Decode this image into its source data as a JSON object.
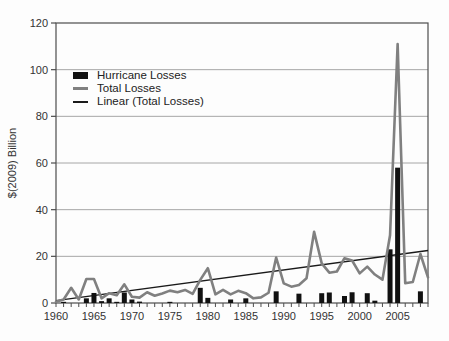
{
  "chart_data": {
    "type": "combo-bar-line",
    "title": "",
    "xlabel": "",
    "ylabel": "$(2009) Billion",
    "ylim": [
      0,
      120
    ],
    "xlim": [
      1960,
      2009
    ],
    "y_ticks": [
      0,
      20,
      40,
      60,
      80,
      100,
      120
    ],
    "x_tick_labels": [
      1960,
      1965,
      1970,
      1975,
      1980,
      1985,
      1990,
      1995,
      2000,
      2005
    ],
    "grid": "horizontal-only",
    "legend_position": "upper-left-inside",
    "years": [
      1960,
      1961,
      1962,
      1963,
      1964,
      1965,
      1966,
      1967,
      1968,
      1969,
      1970,
      1971,
      1972,
      1973,
      1974,
      1975,
      1976,
      1977,
      1978,
      1979,
      1980,
      1981,
      1982,
      1983,
      1984,
      1985,
      1986,
      1987,
      1988,
      1989,
      1990,
      1991,
      1992,
      1993,
      1994,
      1995,
      1996,
      1997,
      1998,
      1999,
      2000,
      2001,
      2002,
      2003,
      2004,
      2005,
      2006,
      2007,
      2008,
      2009
    ],
    "series": [
      {
        "name": "Hurricane Losses",
        "type": "bar",
        "color": "#111111",
        "values": [
          0,
          0.5,
          0,
          0,
          2,
          4.3,
          0.8,
          2,
          0.5,
          4.5,
          1.5,
          0.6,
          0,
          0,
          0,
          0.5,
          0,
          0,
          0,
          6.5,
          2.2,
          0,
          0,
          1.5,
          0,
          2,
          0,
          0,
          0,
          5,
          0,
          0,
          4,
          0,
          0,
          4.2,
          4.5,
          0,
          3,
          4.6,
          0,
          4.2,
          1,
          0,
          23,
          58,
          0,
          0,
          5,
          0
        ]
      },
      {
        "name": "Total Losses",
        "type": "line",
        "color": "#808080",
        "stroke_width": 2.6,
        "values": [
          0.5,
          1.5,
          6.5,
          1.5,
          10.3,
          10.3,
          2,
          4.2,
          3.3,
          8,
          2.7,
          2.3,
          4.6,
          3.1,
          4.1,
          5.3,
          4.6,
          5.6,
          3.9,
          9.9,
          14.9,
          3.7,
          5.6,
          3.7,
          5.2,
          4.2,
          2,
          2.4,
          4.4,
          19.5,
          8.4,
          7,
          7.7,
          10.6,
          30.5,
          17,
          13,
          13.5,
          19.2,
          18.2,
          12.7,
          15.6,
          12.2,
          10,
          29,
          111,
          8.5,
          9,
          21,
          11
        ]
      },
      {
        "name": "Linear (Total Losses)",
        "type": "trend-line",
        "color": "#1a1a1a",
        "stroke_width": 1.3,
        "points": [
          [
            1960,
            1.0
          ],
          [
            2009,
            22.5
          ]
        ]
      }
    ],
    "colors": {
      "bar": "#111111",
      "total_line": "#808080",
      "trend_line": "#1a1a1a",
      "gridline": "#a6a6a6",
      "axis": "#4d4d4d",
      "text": "#333333",
      "background": "#fdfdfd"
    }
  }
}
